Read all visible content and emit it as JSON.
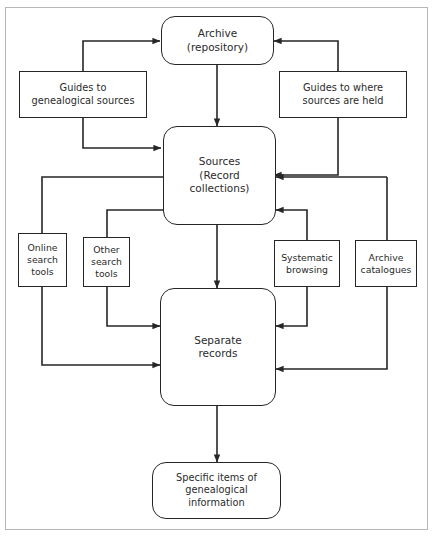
{
  "diagram": {
    "background_color": "#ffffff",
    "border_color": "#b6b6b6",
    "line_color": "#262626",
    "text_color": "#2b2b2b",
    "nodes": {
      "archive": {
        "shape": "rounded-rectangle",
        "lines": [
          "Archive",
          "(repository)"
        ]
      },
      "guides_sources": {
        "shape": "rectangle",
        "lines": [
          "Guides to",
          "genealogical sources"
        ]
      },
      "guides_held": {
        "shape": "rectangle",
        "lines": [
          "Guides to where",
          "sources are held"
        ]
      },
      "sources": {
        "shape": "rounded-rectangle",
        "lines": [
          "Sources",
          "(Record",
          "collections)"
        ]
      },
      "online_search": {
        "shape": "rectangle",
        "lines": [
          "Online",
          "search",
          "tools"
        ]
      },
      "other_search": {
        "shape": "rectangle",
        "lines": [
          "Other",
          "search",
          "tools"
        ]
      },
      "systematic_browsing": {
        "shape": "rectangle",
        "lines": [
          "Systematic",
          "browsing"
        ]
      },
      "archive_catalogues": {
        "shape": "rectangle",
        "lines": [
          "Archive",
          "catalogues"
        ]
      },
      "specific_items": {
        "shape": "rounded-rectangle",
        "lines": [
          "Specific items of",
          "genealogical",
          "information"
        ]
      }
    },
    "edges": [
      {
        "from": "guides_sources",
        "to": "archive",
        "arrow": "to"
      },
      {
        "from": "guides_held",
        "to": "archive",
        "arrow": "to"
      },
      {
        "from": "archive",
        "to": "sources",
        "arrow": "to"
      },
      {
        "from": "guides_sources",
        "to": "sources",
        "arrow": "to"
      },
      {
        "from": "guides_held",
        "to": "sources",
        "arrow": "to"
      },
      {
        "from": "sources",
        "to": "separate_records_via_other_search",
        "arrow": "to"
      },
      {
        "from": "sources",
        "to": "separate_records_via_online_search",
        "arrow": "to"
      },
      {
        "from": "sources",
        "to": "separate_records",
        "arrow": "to"
      },
      {
        "from": "systematic_browsing",
        "to": "sources",
        "arrow": "to"
      },
      {
        "from": "archive_catalogues",
        "to": "sources",
        "arrow": "to"
      },
      {
        "from": "systematic_browsing",
        "to": "separate_records",
        "arrow": "to"
      },
      {
        "from": "archive_catalogues",
        "to": "separate_records",
        "arrow": "to"
      },
      {
        "from": "separate_records",
        "to": "specific_items",
        "arrow": "to"
      }
    ]
  }
}
